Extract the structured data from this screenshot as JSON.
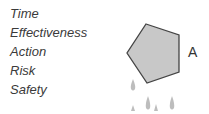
{
  "labels": [
    "Time",
    "Effectiveness",
    "Action",
    "Risk",
    "Safety"
  ],
  "shape": {
    "label": "A",
    "fill": "#c8c8c8",
    "stroke": "#444444"
  },
  "drops_color": "#bdbdbd"
}
